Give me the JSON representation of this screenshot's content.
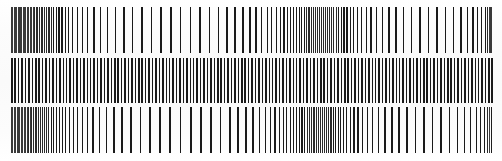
{
  "document": {
    "kind": "scanned-bar-pattern-chart",
    "title": "Bar Pattern Test Chart",
    "description": "Scanned sheet containing three horizontal bands of vertical black bars on white paper",
    "width": 502,
    "height": 161,
    "background_color": "#ffffff",
    "paper_color": "#fdfdfd",
    "bar_color": "#1a1a1a",
    "band_count": 3,
    "visible_text": ""
  },
  "chart_data": {
    "type": "bar",
    "subtitle": "",
    "xlabel": "",
    "ylabel": "",
    "grid": false,
    "legend": "none",
    "orientation": "vertical-lines",
    "xlim": [
      0,
      502
    ],
    "ylim": [
      0,
      161
    ],
    "series": [
      {
        "name": "band-1",
        "row_index": 1,
        "y_top": 7,
        "y_bottom": 53,
        "bar_height": 46,
        "x_start": 11,
        "x_end": 491,
        "bar_count": 117,
        "pattern": "chirp",
        "bar_width_default": 1.2,
        "values": [
          11.0,
          12.3,
          13.6,
          14.9,
          16.2,
          17.5,
          18.8,
          20.1,
          21.4,
          22.7,
          24.0,
          25.4,
          26.8,
          28.2,
          29.6,
          31.0,
          32.5,
          34.0,
          35.6,
          37.2,
          38.9,
          40.6,
          42.4,
          44.3,
          46.3,
          48.4,
          50.6,
          53.0,
          55.6,
          58.4,
          61.4,
          64.7,
          68.3,
          72.3,
          76.7,
          81.6,
          87.0,
          93.0,
          99.6,
          106.8,
          114.6,
          123.0,
          131.8,
          141.0,
          150.5,
          160.2,
          170.0,
          179.8,
          189.6,
          199.2,
          208.6,
          217.6,
          226.2,
          234.4,
          242.0,
          249.0,
          255.4,
          261.2,
          266.5,
          271.3,
          275.7,
          279.7,
          283.4,
          286.8,
          290.0,
          293.0,
          295.9,
          298.6,
          301.2,
          303.7,
          306.1,
          308.4,
          310.6,
          312.8,
          314.9,
          317.0,
          319.0,
          321.0,
          323.0,
          325.0,
          327.0,
          329.0,
          331.1,
          333.3,
          335.6,
          338.0,
          340.6,
          343.4,
          346.4,
          349.6,
          353.1,
          356.9,
          361.0,
          365.5,
          370.4,
          375.8,
          381.7,
          388.1,
          395.1,
          402.6,
          410.6,
          419.0,
          427.6,
          436.2,
          444.6,
          452.6,
          460.0,
          466.6,
          472.4,
          477.3,
          481.3,
          484.5,
          487.0,
          488.9,
          490.3,
          491.0,
          491.0,
          491.0,
          491.0
        ]
      },
      {
        "name": "band-2",
        "row_index": 2,
        "y_top": 58,
        "y_bottom": 103,
        "bar_height": 45,
        "x_start": 11,
        "x_end": 491,
        "bar_count": 141,
        "pattern": "uniform",
        "pitch": 3.42,
        "bar_width_default": 1.5,
        "values": [
          11.0,
          14.4,
          17.8,
          21.3,
          24.7,
          28.1,
          31.6,
          35.0,
          38.4,
          41.9,
          45.3,
          48.7,
          52.2,
          55.6,
          59.0,
          62.5,
          65.9,
          69.3,
          72.8,
          76.2,
          79.6,
          83.1,
          86.5,
          89.9,
          93.4,
          96.8,
          100.2,
          103.7,
          107.1,
          110.5,
          114.0,
          117.4,
          120.8,
          124.3,
          127.7,
          131.1,
          134.6,
          138.0,
          141.4,
          144.9,
          148.3,
          151.7,
          155.2,
          158.6,
          162.0,
          165.5,
          168.9,
          172.3,
          175.8,
          179.2,
          182.6,
          186.1,
          189.5,
          192.9,
          196.4,
          199.8,
          203.2,
          206.7,
          210.1,
          213.5,
          217.0,
          220.4,
          223.8,
          227.3,
          230.7,
          234.1,
          237.6,
          241.0,
          244.4,
          247.9,
          251.3,
          254.7,
          258.2,
          261.6,
          265.0,
          268.5,
          271.9,
          275.3,
          278.8,
          282.2,
          285.6,
          289.1,
          292.5,
          295.9,
          299.4,
          302.8,
          306.2,
          309.7,
          313.1,
          316.5,
          320.0,
          323.4,
          326.8,
          330.3,
          333.7,
          337.1,
          340.6,
          344.0,
          347.4,
          350.9,
          354.3,
          357.7,
          361.2,
          364.6,
          368.0,
          371.5,
          374.9,
          378.3,
          381.8,
          385.2,
          388.6,
          392.1,
          395.5,
          398.9,
          402.4,
          405.8,
          409.2,
          412.7,
          416.1,
          419.5,
          423.0,
          426.4,
          429.8,
          433.3,
          436.7,
          440.1,
          443.6,
          447.0,
          450.4,
          453.9,
          457.3,
          460.7,
          464.2,
          467.6,
          471.0,
          474.5,
          477.9,
          481.3,
          484.8,
          488.2,
          491.0
        ]
      },
      {
        "name": "band-3",
        "row_index": 3,
        "y_top": 107,
        "y_bottom": 153,
        "bar_height": 46,
        "x_start": 11,
        "x_end": 491,
        "bar_count": 115,
        "pattern": "chirp",
        "bar_width_default": 1.2,
        "values": [
          11.0,
          12.4,
          13.8,
          15.2,
          16.6,
          18.0,
          19.4,
          20.8,
          22.2,
          23.7,
          25.2,
          26.7,
          28.2,
          29.8,
          31.4,
          33.0,
          34.7,
          36.4,
          38.2,
          40.0,
          41.9,
          43.9,
          46.0,
          48.2,
          50.5,
          53.0,
          55.7,
          58.6,
          61.7,
          65.0,
          68.6,
          72.5,
          76.8,
          81.5,
          86.7,
          92.4,
          98.7,
          105.6,
          113.2,
          121.4,
          130.2,
          139.5,
          149.2,
          159.2,
          169.4,
          179.7,
          190.0,
          200.2,
          210.2,
          219.8,
          228.9,
          237.4,
          245.2,
          252.3,
          258.7,
          264.5,
          269.7,
          274.4,
          278.7,
          282.6,
          286.2,
          289.6,
          292.8,
          295.8,
          298.7,
          301.4,
          304.0,
          306.5,
          308.9,
          311.2,
          313.4,
          315.6,
          317.7,
          319.8,
          321.9,
          324.0,
          326.1,
          328.2,
          330.4,
          332.7,
          335.1,
          337.6,
          340.3,
          343.2,
          346.3,
          349.7,
          353.4,
          357.4,
          361.8,
          366.6,
          371.9,
          377.7,
          384.0,
          390.9,
          398.3,
          406.2,
          414.5,
          423.1,
          431.8,
          440.4,
          448.7,
          456.5,
          463.6,
          470.0,
          475.6,
          480.3,
          484.1,
          487.0,
          489.1,
          490.5,
          491.0,
          491.0,
          491.0,
          491.0,
          491.0,
          491.0,
          491.0,
          491.0
        ]
      }
    ]
  }
}
